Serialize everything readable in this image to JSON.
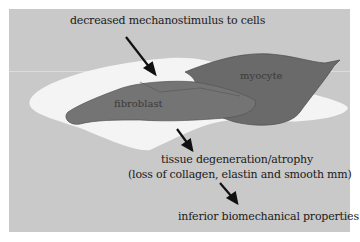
{
  "labels": {
    "top": "decreased mechanostimulus to cells",
    "myocyte": "myocyte",
    "fibroblast": "fibroblast",
    "middle_line1": "tissue degeneration/atrophy",
    "middle_line2": "(loss of collagen, elastin and smooth mm)",
    "bottom": "inferior biomechanical properties"
  },
  "colors": {
    "background_panel": "#c9c9c9",
    "tissue_region": "#f4f4f4",
    "cells": "#6a6a6a",
    "text": "#1a1a1a"
  }
}
